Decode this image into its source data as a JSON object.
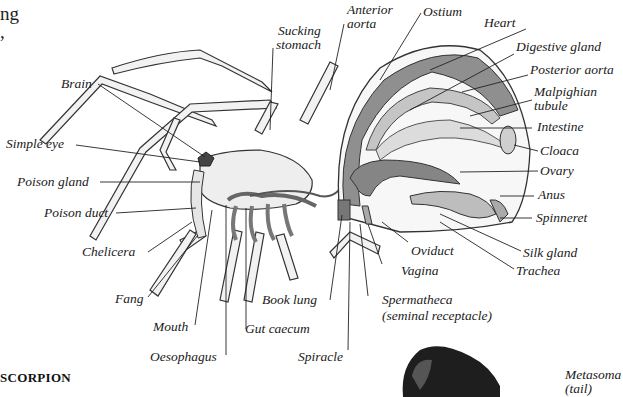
{
  "page": {
    "text_fragments": [
      "ng",
      ","
    ],
    "section_heading": "SCORPION"
  },
  "diagram": {
    "labels": [
      {
        "id": "brain",
        "text": "Brain"
      },
      {
        "id": "simple-eye",
        "text": "Simple eye"
      },
      {
        "id": "poison-gland",
        "text": "Poison gland"
      },
      {
        "id": "poison-duct",
        "text": "Poison duct"
      },
      {
        "id": "chelicera",
        "text": "Chelicera"
      },
      {
        "id": "fang",
        "text": "Fang"
      },
      {
        "id": "mouth",
        "text": "Mouth"
      },
      {
        "id": "oesophagus",
        "text": "Oesophagus"
      },
      {
        "id": "gut-caecum",
        "text": "Gut caecum"
      },
      {
        "id": "book-lung",
        "text": "Book lung"
      },
      {
        "id": "spiracle",
        "text": "Spiracle"
      },
      {
        "id": "sucking-stomach-1",
        "text": "Sucking"
      },
      {
        "id": "sucking-stomach-2",
        "text": "stomach"
      },
      {
        "id": "anterior-aorta-1",
        "text": "Anterior"
      },
      {
        "id": "anterior-aorta-2",
        "text": "aorta"
      },
      {
        "id": "ostium",
        "text": "Ostium"
      },
      {
        "id": "heart",
        "text": "Heart"
      },
      {
        "id": "digestive-gland",
        "text": "Digestive gland"
      },
      {
        "id": "posterior-aorta",
        "text": "Posterior aorta"
      },
      {
        "id": "malpighian-1",
        "text": "Malpighian"
      },
      {
        "id": "malpighian-2",
        "text": "tubule"
      },
      {
        "id": "intestine",
        "text": "Intestine"
      },
      {
        "id": "cloaca",
        "text": "Cloaca"
      },
      {
        "id": "ovary",
        "text": "Ovary"
      },
      {
        "id": "anus",
        "text": "Anus"
      },
      {
        "id": "spinneret",
        "text": "Spinneret"
      },
      {
        "id": "silk-gland",
        "text": "Silk gland"
      },
      {
        "id": "trachea",
        "text": "Trachea"
      },
      {
        "id": "oviduct",
        "text": "Oviduct"
      },
      {
        "id": "vagina",
        "text": "Vagina"
      },
      {
        "id": "spermatheca-1",
        "text": "Spermatheca"
      },
      {
        "id": "spermatheca-2",
        "text": "(seminal receptacle)"
      },
      {
        "id": "metasoma-1",
        "text": "Metasoma"
      },
      {
        "id": "metasoma-2",
        "text": "(tail)"
      }
    ]
  },
  "colors": {
    "line": "#222222",
    "tissue_dark": "#8a8a8a",
    "tissue_mid": "#b5b5b5",
    "tissue_light": "#e4e4e4",
    "scorpion": "#1e1e1e"
  }
}
